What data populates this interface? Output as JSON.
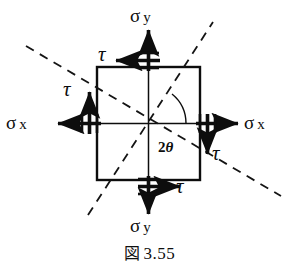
{
  "figure": {
    "caption_symbol": "図",
    "caption_number": "3.55",
    "labels": {
      "sigma_top": "σ",
      "sigma_top_sub": "y",
      "sigma_bottom": "σ",
      "sigma_bottom_sub": "y",
      "sigma_left": "σ",
      "sigma_left_sub": "x",
      "sigma_right": "σ",
      "sigma_right_sub": "x",
      "tau_top": "τ",
      "tau_left": "τ",
      "tau_right": "τ",
      "tau_bottom": "τ",
      "angle": "2",
      "angle_symbol": "θ"
    },
    "colors": {
      "ink": "#0d0d0d",
      "background": "#ffffff"
    },
    "geometry": {
      "square_left": 97,
      "square_top": 67,
      "square_right": 200,
      "square_bottom": 180,
      "center_x": 148,
      "center_y": 123
    },
    "elements": {
      "square_name": "stress-element-square",
      "axis_horizontal": "element-axis-horizontal",
      "axis_vertical": "element-axis-vertical",
      "dashed_line_1": "principal-plane-line-descending",
      "dashed_line_2": "principal-plane-line-ascending",
      "angle_arc": "angle-arc-2theta"
    }
  }
}
